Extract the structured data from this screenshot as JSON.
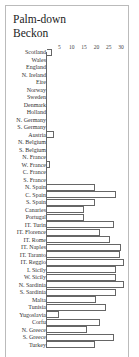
{
  "chart_data": {
    "type": "bar",
    "orientation": "horizontal",
    "title": "Palm-down Beckon",
    "title_lines": [
      "Palm-down",
      "Beckon"
    ],
    "xlabel": "",
    "ylabel": "",
    "xlim": [
      0,
      31
    ],
    "x_ticks": [
      "5",
      "10",
      "15",
      "20",
      "25",
      "30"
    ],
    "x_tick_values": [
      5,
      10,
      15,
      20,
      25,
      30
    ],
    "grid": false,
    "legend": null,
    "categories": [
      "Scotland",
      "Wales",
      "England",
      "N. Ireland",
      "Eire",
      "Norway",
      "Sweden",
      "Denmark",
      "Holland",
      "N. Germany",
      "S. Germany",
      "Austria",
      "N. Belgium",
      "S. Belgium",
      "N. France",
      "W. France",
      "C. France",
      "S. France",
      "N. Spain",
      "C. Spain",
      "S. Spain",
      "Canaries",
      "Portugal",
      "IT. Turin",
      "IT. Florence",
      "IT. Rome",
      "IT. Naples",
      "IT. Taranto",
      "IT. Reggio",
      "I. Sicily",
      "W. Sicily",
      "N. Sardinia",
      "S. Sardinia",
      "Malta",
      "Tunisia",
      "Yugoslavia",
      "Corfu",
      "N. Greece",
      "S. Greece",
      "Turkey"
    ],
    "values": [
      2,
      0,
      0,
      0,
      0,
      0,
      0,
      0,
      0,
      0,
      0,
      3,
      0,
      0,
      0,
      1,
      0,
      0,
      19.5,
      28,
      19.5,
      15,
      15,
      27,
      21.5,
      25.5,
      30,
      29.5,
      31,
      28,
      28,
      31,
      28,
      20,
      24,
      5,
      21.5,
      16,
      27,
      19.5
    ]
  },
  "colors": {
    "bar_outline": "#666666",
    "bar_fill": "#ffffff",
    "frame": "#bbbbbb",
    "text": "#333333"
  }
}
